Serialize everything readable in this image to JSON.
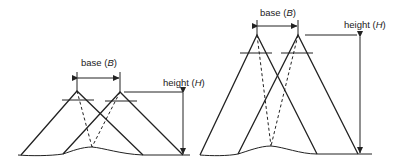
{
  "diagrams": [
    {
      "id": "short-base-low-height",
      "base_label": "base",
      "base_symbol": "B",
      "height_label": "height",
      "height_symbol": "H"
    },
    {
      "id": "short-base-tall-height",
      "base_label": "base",
      "base_symbol": "B",
      "height_label": "height",
      "height_symbol": "H"
    }
  ],
  "colors": {
    "stroke": "#222222",
    "background": "#ffffff"
  }
}
